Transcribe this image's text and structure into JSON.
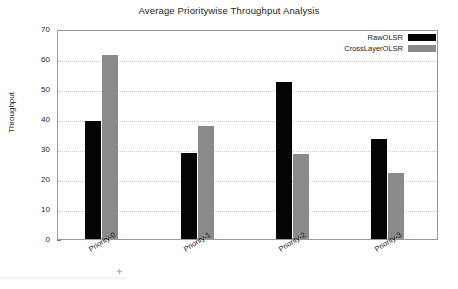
{
  "chart_data": {
    "type": "bar",
    "title": "Average Prioritywise Throughput Analysis",
    "xlabel": "",
    "ylabel": "Throughput",
    "categories": [
      "Priority-0",
      "Priority-1",
      "Priority-2",
      "Priority-3"
    ],
    "series": [
      {
        "name": "RawOLSR",
        "color": "#050505",
        "values": [
          39.4,
          28.6,
          52.3,
          33.4
        ]
      },
      {
        "name": "CrossLayerOLSR",
        "color": "#8a8a8a",
        "values": [
          61.5,
          37.8,
          28.5,
          22.0
        ]
      }
    ],
    "ylim": [
      0,
      70
    ],
    "ytick_labels": [
      "0",
      "10",
      "20",
      "30",
      "40",
      "50",
      "60",
      "70"
    ],
    "ytick_values": [
      0,
      10,
      20,
      30,
      40,
      50,
      60,
      70
    ],
    "grid": true,
    "legend_position": "top-right"
  },
  "legend": {
    "entries": [
      {
        "label": "RawOLSR",
        "swatch": "raw"
      },
      {
        "label": "CrossLayerOLSR",
        "swatch": "cross"
      }
    ]
  }
}
